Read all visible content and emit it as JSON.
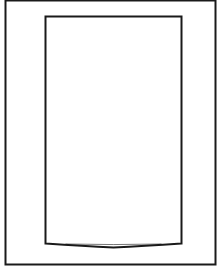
{
  "diagram": {
    "type": "line-drawing",
    "background": "#ffffff",
    "stroke_color": "#1a1a1a",
    "outer_frame": {
      "x": 5.5,
      "y": 0.5,
      "width": 210,
      "height": 264,
      "stroke_width": 2
    },
    "inner_panel": {
      "x": 45.5,
      "y": 16.5,
      "width": 136,
      "height": 227,
      "stroke_width": 2,
      "bottom_bow_depth": 4
    }
  }
}
